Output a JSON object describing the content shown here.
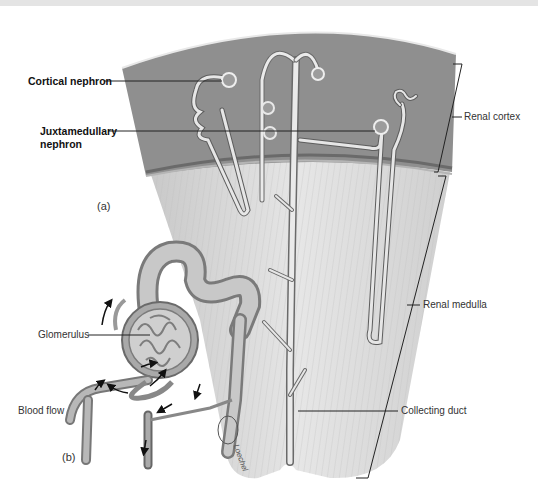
{
  "figure": {
    "panels": [
      {
        "id": "a",
        "label": "(a)"
      },
      {
        "id": "b",
        "label": "(b)"
      }
    ],
    "labels": {
      "cortical_nephron": "Cortical nephron",
      "juxtamedullary_nephron_line1": "Juxtamedullary",
      "juxtamedullary_nephron_line2": "nephron",
      "renal_cortex": "Renal cortex",
      "renal_medulla": "Renal medulla",
      "collecting_duct": "Collecting duct",
      "glomerulus": "Glomerulus",
      "blood_flow": "Blood flow"
    },
    "signature": "Loechel",
    "colors": {
      "cortex": "#8f8f8f",
      "medulla": "#dcdcdc",
      "tubule": "#e8e8e8",
      "vessel": "#a8a8a8",
      "leader_line": "#222222"
    }
  }
}
